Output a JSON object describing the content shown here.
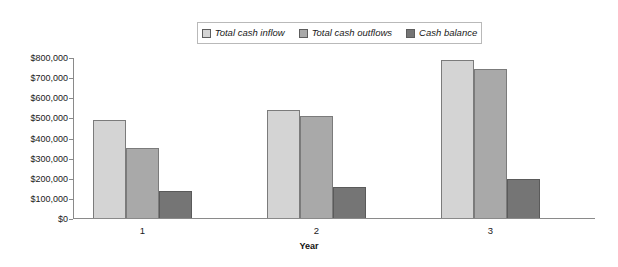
{
  "chart_data": {
    "type": "bar",
    "title": "",
    "xlabel": "Year",
    "ylabel": "",
    "categories": [
      "1",
      "2",
      "3"
    ],
    "series": [
      {
        "name": "Total cash inflow",
        "color": "#d4d4d4",
        "values": [
          485000,
          535000,
          785000
        ]
      },
      {
        "name": "Total cash outflows",
        "color": "#a9a9a9",
        "values": [
          350000,
          505000,
          740000
        ]
      },
      {
        "name": "Cash balance",
        "color": "#757575",
        "values": [
          135000,
          155000,
          195000
        ]
      }
    ],
    "ylim": [
      0,
      800000
    ],
    "ytick_values": [
      0,
      100000,
      200000,
      300000,
      400000,
      500000,
      600000,
      700000,
      800000
    ],
    "ytick_labels": [
      "$0",
      "$100,000",
      "$200,000",
      "$300,000",
      "$400,000",
      "$500,000",
      "$600,000",
      "$700,000",
      "$800,000"
    ],
    "grid": false,
    "legend_position": "top-center"
  },
  "legend": {
    "entries": [
      {
        "label": "Total cash inflow"
      },
      {
        "label": "Total cash outflows"
      },
      {
        "label": "Cash balance"
      }
    ]
  },
  "axes": {
    "x_title": "Year"
  }
}
